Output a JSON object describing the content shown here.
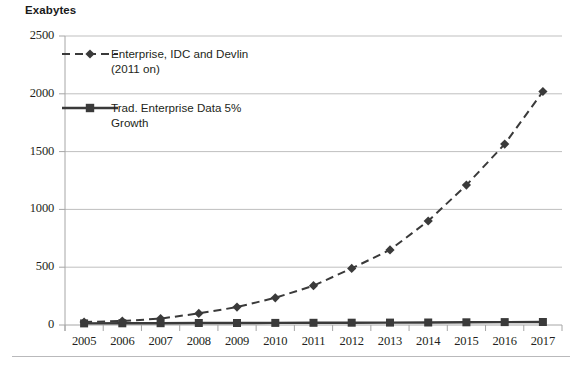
{
  "figure": {
    "y_axis_title": "Exabytes",
    "background_color": "#ffffff",
    "line_color": "#3a3a3a",
    "grid_color": "#bfbfbf",
    "axis_color": "#a6a6a6"
  },
  "chart_data": {
    "type": "line",
    "title": "",
    "subtitle": "",
    "xlabel": "",
    "ylabel": "Exabytes",
    "ylim": [
      0,
      2500
    ],
    "ytick_values": [
      0,
      500,
      1000,
      1500,
      2000,
      2500
    ],
    "ytick_labels": [
      "0",
      "500",
      "1000",
      "1500",
      "2000",
      "2500"
    ],
    "grid": "horizontal",
    "legend_position": "upper-left-inside",
    "categories": [
      "2005",
      "2006",
      "2007",
      "2008",
      "2009",
      "2010",
      "2011",
      "2012",
      "2013",
      "2014",
      "2015",
      "2016",
      "2017"
    ],
    "x": [
      2005,
      2006,
      2007,
      2008,
      2009,
      2010,
      2011,
      2012,
      2013,
      2014,
      2015,
      2016,
      2017
    ],
    "series": [
      {
        "name": "Enterprise, IDC and Devlin (2011 on)",
        "legend_label": "Enterprise, IDC and Devlin\n(2011 on)",
        "style": "dashed",
        "marker": "diamond",
        "color": "#3a3a3a",
        "values": [
          25,
          35,
          55,
          100,
          155,
          235,
          340,
          490,
          650,
          900,
          1210,
          1565,
          2020
        ]
      },
      {
        "name": "Trad. Enterprise Data 5% Growth",
        "legend_label": "Trad. Enterprise Data 5%\nGrowth",
        "style": "solid",
        "marker": "square",
        "color": "#3a3a3a",
        "values": [
          14,
          15,
          16,
          17,
          17,
          18,
          19,
          20,
          21,
          22,
          23,
          25,
          26
        ]
      }
    ]
  }
}
